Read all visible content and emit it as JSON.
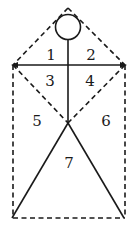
{
  "diagram": {
    "labels": [
      {
        "id": "1",
        "text": "1",
        "x": 51,
        "y": 56
      },
      {
        "id": "2",
        "text": "2",
        "x": 91,
        "y": 56
      },
      {
        "id": "3",
        "text": "3",
        "x": 50,
        "y": 82
      },
      {
        "id": "4",
        "text": "4",
        "x": 90,
        "y": 82
      },
      {
        "id": "5",
        "text": "5",
        "x": 37,
        "y": 122
      },
      {
        "id": "6",
        "text": "6",
        "x": 106,
        "y": 122
      },
      {
        "id": "7",
        "text": "7",
        "x": 69,
        "y": 164
      }
    ],
    "colors": {
      "stroke": "#1a1a1a",
      "background": "#ffffff"
    }
  }
}
